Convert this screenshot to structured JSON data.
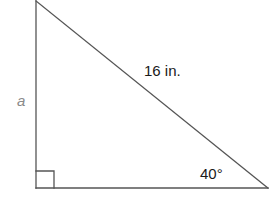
{
  "diagram": {
    "type": "right-triangle",
    "vertices": {
      "top": [
        36,
        1
      ],
      "right_angle": [
        36,
        188
      ],
      "bottom_right": [
        268,
        188
      ]
    },
    "right_angle_marker_size": 17,
    "stroke_color": "#555555",
    "labels": {
      "hypotenuse": "16 in.",
      "vertical_leg": "a",
      "angle": "40°"
    },
    "label_colors": {
      "hypotenuse": "#1a1a1a",
      "vertical_leg": "#8a8a8a",
      "angle": "#1a1a1a"
    }
  }
}
